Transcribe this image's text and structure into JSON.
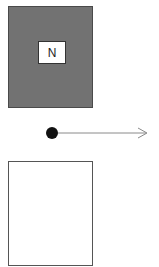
{
  "diagram": {
    "top_box": {
      "label": "N",
      "fill": "#727272"
    },
    "connector": {
      "start": "dot",
      "end": "arrow",
      "color": "#888888"
    },
    "bottom_box": {
      "label": "",
      "fill": "#ffffff"
    }
  }
}
